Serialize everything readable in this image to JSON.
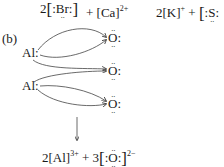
{
  "row_a": {
    "bromide": {
      "coef": "2",
      "lb": "[",
      "pre": ":",
      "symbol": "Br",
      "post": ":",
      "rb": "]"
    },
    "plus1": "+",
    "calcium": {
      "text": "[Ca]",
      "charge": "2+"
    },
    "potassium": {
      "coef": "2",
      "text": "[K]",
      "charge": "+"
    },
    "plus2": "+",
    "sulfide": {
      "lb": "[",
      "pre": ":",
      "symbol": "S",
      "post": ":"
    }
  },
  "part_b": {
    "label": "(b)",
    "aluminum_atoms": [
      {
        "symbol": "Al",
        "dots": ":"
      },
      {
        "symbol": "Al",
        "dots": ":"
      }
    ],
    "oxygen_atoms": [
      {
        "symbol": "O",
        "dots": ":"
      },
      {
        "symbol": "O",
        "dots": ":"
      },
      {
        "symbol": "O",
        "dots": ":"
      }
    ],
    "product": {
      "al_coef": "2",
      "al_text": "[Al]",
      "al_charge": "3+",
      "plus": "+",
      "o_coef": "3",
      "o_lb": "[",
      "o_pre": ":",
      "o_symbol": "O",
      "o_post": ":",
      "o_rb": "]",
      "o_charge": "2−"
    }
  }
}
